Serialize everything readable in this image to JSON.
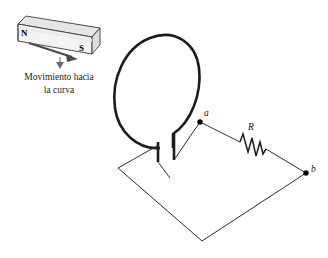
{
  "figure": {
    "background_color": "#ffffff",
    "line_color": "#2b2b2b",
    "loop_color": "#1c1c1c",
    "magnet": {
      "north_label": "N",
      "south_label": "S",
      "body_fill": "#f2f2f2",
      "top_fill": "#e4e4e4",
      "end_fill": "#dcdcdc",
      "outline_color": "#3a3a3a"
    },
    "caption": {
      "line1": "Movimiento hacia",
      "line2": "la curva"
    },
    "circuit": {
      "node_a_label": "a",
      "node_b_label": "b",
      "resistor_label": "R"
    }
  }
}
